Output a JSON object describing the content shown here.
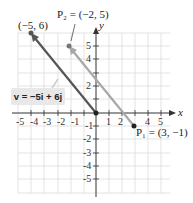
{
  "diagram": {
    "axes": {
      "x_label": "x",
      "y_label": "y",
      "range": [
        -5,
        5
      ]
    },
    "x_ticks": [
      "-5",
      "-4",
      "-3",
      "-2",
      "-1",
      "1",
      "2",
      "4",
      "5"
    ],
    "y_ticks": [
      "5",
      "4",
      "2",
      "-1",
      "-2",
      "-3",
      "-4",
      "-5"
    ],
    "points": {
      "tip": {
        "label": "(−5, 6)",
        "x": -5,
        "y": 6
      },
      "p2": {
        "label": "P₂ = (−2, 5)",
        "x": -2,
        "y": 5
      },
      "p1": {
        "label": "P₁ = (3, −1)",
        "x": 3,
        "y": -1
      },
      "origin": {
        "x": 0,
        "y": 0
      }
    },
    "vector_label": "v = −5i + 6j",
    "colors": {
      "position_vector": "#555555",
      "displacement_vector": "#aaaaaa",
      "grid": "#dddddd",
      "label_box": "#e8e8e8"
    }
  }
}
